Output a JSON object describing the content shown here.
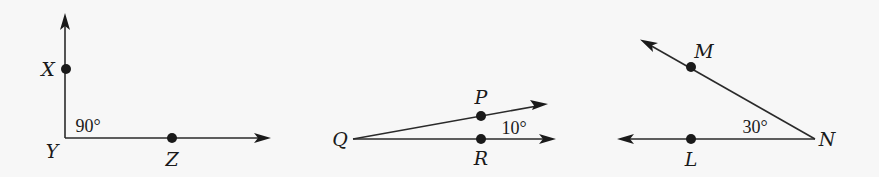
{
  "diagram": {
    "background": "#f7f7f7",
    "ink": "#1a1a1a",
    "angles": [
      {
        "name": "XYZ",
        "vertex": "Y",
        "measure": "90°",
        "points": [
          {
            "label": "X",
            "x": 66,
            "y": 69,
            "label_x": 48,
            "label_y": 76
          },
          {
            "label": "Y",
            "x": 65,
            "y": 138,
            "label_x": 52,
            "label_y": 158,
            "vertex": true
          },
          {
            "label": "Z",
            "x": 172,
            "y": 138,
            "label_x": 172,
            "label_y": 166
          }
        ],
        "angle_label": {
          "text": "90°",
          "x": 88,
          "y": 132
        },
        "rays": [
          {
            "from": [
              65,
              138
            ],
            "to": [
              65,
              14
            ]
          },
          {
            "from": [
              65,
              138
            ],
            "to": [
              270,
              138
            ]
          }
        ]
      },
      {
        "name": "PQR",
        "vertex": "Q",
        "measure": "10°",
        "points": [
          {
            "label": "P",
            "x": 481,
            "y": 116,
            "label_x": 481,
            "label_y": 104
          },
          {
            "label": "Q",
            "x": 353,
            "y": 139,
            "label_x": 340,
            "label_y": 146,
            "vertex": true
          },
          {
            "label": "R",
            "x": 481,
            "y": 139,
            "label_x": 481,
            "label_y": 165
          }
        ],
        "angle_label": {
          "text": "10°",
          "x": 514,
          "y": 134
        },
        "rays": [
          {
            "from": [
              353,
              139
            ],
            "to": [
              547,
              104
            ]
          },
          {
            "from": [
              353,
              139
            ],
            "to": [
              555,
              139
            ]
          }
        ]
      },
      {
        "name": "MNL",
        "vertex": "N",
        "measure": "30°",
        "points": [
          {
            "label": "M",
            "x": 691,
            "y": 67,
            "label_x": 704,
            "label_y": 58
          },
          {
            "label": "N",
            "x": 815,
            "y": 139,
            "label_x": 827,
            "label_y": 146,
            "vertex": true
          },
          {
            "label": "L",
            "x": 691,
            "y": 139,
            "label_x": 691,
            "label_y": 166
          }
        ],
        "angle_label": {
          "text": "30°",
          "x": 755,
          "y": 133
        },
        "rays": [
          {
            "from": [
              815,
              139
            ],
            "to": [
              641,
              40
            ]
          },
          {
            "from": [
              815,
              139
            ],
            "to": [
              618,
              139
            ]
          }
        ]
      }
    ]
  }
}
